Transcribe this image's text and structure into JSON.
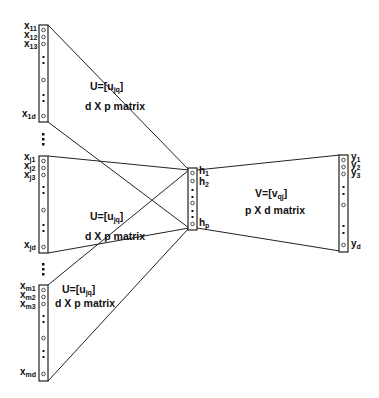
{
  "input_blocks": [
    {
      "labels": [
        "x11",
        "x12",
        "x13",
        "x1d"
      ],
      "weight": "U=[ujq]",
      "dims": "d X p matrix"
    },
    {
      "labels": [
        "xj1",
        "xj2",
        "xj3",
        "xjd"
      ],
      "weight": "U=[ujq]",
      "dims": "d X p matrix"
    },
    {
      "labels": [
        "xm1",
        "xm2",
        "xm3",
        "xmd"
      ],
      "weight": "U=[ujq]",
      "dims": "d X p matrix"
    }
  ],
  "hidden": {
    "labels": [
      "h1",
      "h2",
      "hp"
    ]
  },
  "output": {
    "labels": [
      "y1",
      "y2",
      "y3",
      "yd"
    ],
    "weight": "V=[vqj]",
    "dims": "p X d matrix"
  }
}
